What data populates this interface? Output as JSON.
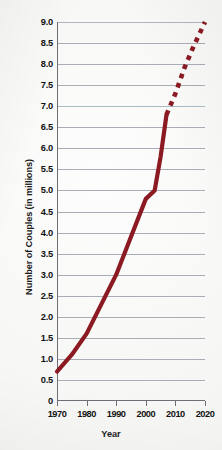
{
  "chart_data": {
    "type": "line",
    "title": "",
    "xlabel": "Year",
    "ylabel": "Number of Couples (in millions)",
    "xlim": [
      1970,
      2020
    ],
    "ylim": [
      0,
      9.0
    ],
    "grid": true,
    "legend_position": "none",
    "x_tick_labels": [
      "1970",
      "1980",
      "1990",
      "2000",
      "2010",
      "2020"
    ],
    "x_ticks": [
      1970,
      1980,
      1990,
      2000,
      2010,
      2020
    ],
    "y_tick_labels": [
      "9.0",
      "8.5",
      "8.0",
      "7.5",
      "7.0",
      "6.5",
      "6.0",
      "5.5",
      "5.0",
      "4.5",
      "4.0",
      "3.5",
      "3.0",
      "2.5",
      "2.0",
      "1.5",
      "1.0",
      "0.5",
      "0"
    ],
    "y_ticks": [
      9.0,
      8.5,
      8.0,
      7.5,
      7.0,
      6.5,
      6.0,
      5.5,
      5.0,
      4.5,
      4.0,
      3.5,
      3.0,
      2.5,
      2.0,
      1.5,
      1.0,
      0.5,
      0
    ],
    "line_color": "#8b1a22",
    "series": [
      {
        "name": "Observed",
        "style": "solid",
        "x": [
          1970,
          1975,
          1980,
          1985,
          1990,
          1995,
          2000,
          2003,
          2005,
          2007
        ],
        "values": [
          0.7,
          1.1,
          1.6,
          2.3,
          3.0,
          3.9,
          4.8,
          5.0,
          5.8,
          6.8
        ]
      },
      {
        "name": "Projected",
        "style": "dotted",
        "x": [
          2007,
          2010,
          2013,
          2016,
          2020
        ],
        "values": [
          6.8,
          7.3,
          7.9,
          8.4,
          9.0
        ]
      }
    ]
  },
  "axes": {
    "y_title": "Number of Couples (in millions)",
    "x_title": "Year"
  }
}
